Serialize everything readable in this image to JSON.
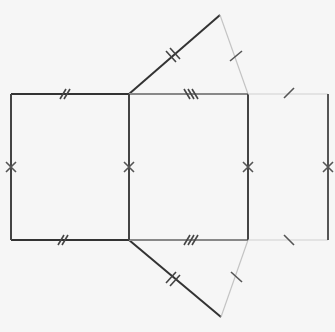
{
  "diagram": {
    "colors": {
      "background": "#f6f6f6",
      "dark_edge": "#333333",
      "mid_edge": "#777777",
      "light_edge": "#bdbdbd"
    },
    "faces": [
      {
        "name": "left-rectangle",
        "points": [
          [
            11,
            94
          ],
          [
            129,
            94
          ],
          [
            129,
            240
          ],
          [
            11,
            240
          ]
        ]
      },
      {
        "name": "middle-rectangle",
        "points": [
          [
            129,
            94
          ],
          [
            248,
            94
          ],
          [
            248,
            240
          ],
          [
            129,
            240
          ]
        ]
      },
      {
        "name": "right-rectangle",
        "points": [
          [
            248,
            94
          ],
          [
            328,
            94
          ],
          [
            328,
            240
          ],
          [
            248,
            240
          ]
        ]
      },
      {
        "name": "top-triangle",
        "points": [
          [
            129,
            94
          ],
          [
            220,
            15
          ],
          [
            248,
            94
          ]
        ]
      },
      {
        "name": "bottom-triangle",
        "points": [
          [
            129,
            240
          ],
          [
            221,
            317
          ],
          [
            248,
            240
          ]
        ]
      }
    ],
    "tick_marks": {
      "single": "side type A (1 tick)",
      "double": "side type B (2 ticks)",
      "triple": "side type C (3 ticks)",
      "cross": "height (x mark)"
    }
  }
}
